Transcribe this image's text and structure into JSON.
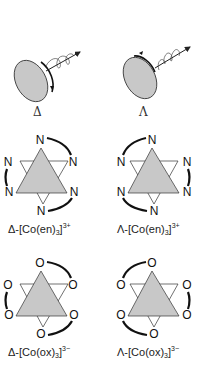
{
  "figure": {
    "helix": {
      "delta_symbol": "Δ",
      "lambda_symbol": "Λ"
    },
    "en_complexes": {
      "left": {
        "prefix": "Δ-[Co(en)",
        "sub": "3",
        "close": "]",
        "charge": "3+",
        "atom": "N"
      },
      "right": {
        "prefix": "Λ-[Co(en)",
        "sub": "3",
        "close": "]",
        "charge": "3+",
        "atom": "N"
      }
    },
    "ox_complexes": {
      "left": {
        "prefix": "Δ-[Co(ox)",
        "sub": "3",
        "close": "]",
        "charge": "3−",
        "atom": "O"
      },
      "right": {
        "prefix": "Λ-[Co(ox)",
        "sub": "3",
        "close": "]",
        "charge": "3−",
        "atom": "O"
      }
    },
    "colors": {
      "fill": "#c8c8c8",
      "stroke": "#222222",
      "background": "#ffffff"
    }
  }
}
